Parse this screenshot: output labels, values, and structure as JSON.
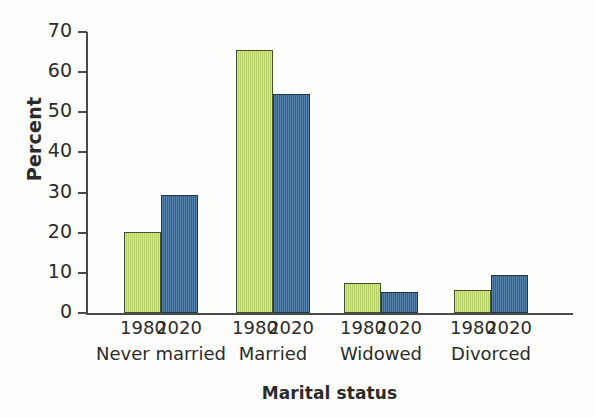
{
  "figure": {
    "title_remnant": "Marital status of the population",
    "background_color": "#fdfdfc"
  },
  "axis": {
    "y_title": "Percent",
    "x_title": "Marital status",
    "y_ticks": [
      "0",
      "10",
      "20",
      "30",
      "40",
      "50",
      "60",
      "70"
    ]
  },
  "series_colors": {
    "1980": "#bfd96e",
    "2020": "#3b6d9e",
    "outline_green": "#44502f",
    "outline_blue": "#25354a",
    "axis": "#4a4a4a",
    "text": "#2b2b2b"
  },
  "groups": [
    {
      "name": "Never married",
      "bars": [
        {
          "year": "1980",
          "value": 20.3
        },
        {
          "year": "2020",
          "value": 29.4
        }
      ]
    },
    {
      "name": "Married",
      "bars": [
        {
          "year": "1980",
          "value": 65.5
        },
        {
          "year": "2020",
          "value": 54.5
        }
      ]
    },
    {
      "name": "Widowed",
      "bars": [
        {
          "year": "1980",
          "value": 7.4
        },
        {
          "year": "2020",
          "value": 5.3
        }
      ]
    },
    {
      "name": "Divorced",
      "bars": [
        {
          "year": "1980",
          "value": 5.7
        },
        {
          "year": "2020",
          "value": 9.5
        }
      ]
    }
  ],
  "chart_data": {
    "type": "bar",
    "title": "",
    "xlabel": "Marital status",
    "ylabel": "Percent",
    "categories": [
      "Never married",
      "Married",
      "Widowed",
      "Divorced"
    ],
    "series": [
      {
        "name": "1980",
        "color": "#bfd96e",
        "values": [
          20.3,
          65.5,
          7.4,
          5.7
        ]
      },
      {
        "name": "2020",
        "color": "#3b6d9e",
        "values": [
          29.4,
          54.5,
          5.3,
          9.5
        ]
      }
    ],
    "ylim": [
      0,
      70
    ],
    "ytick_step": 10,
    "yticks": [
      0,
      10,
      20,
      30,
      40,
      50,
      60,
      70
    ],
    "grid": false,
    "legend": "none",
    "group_tick_labels": [
      "1980",
      "2020"
    ]
  }
}
